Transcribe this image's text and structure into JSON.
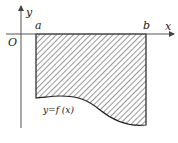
{
  "diagram": {
    "labels": {
      "origin": "O",
      "y_axis": "y",
      "x_axis": "x",
      "a": "a",
      "b": "b",
      "curve": "y=f (x)"
    },
    "colors": {
      "ink": "#222222",
      "axis": "#555555",
      "background": "#ffffff"
    }
  }
}
